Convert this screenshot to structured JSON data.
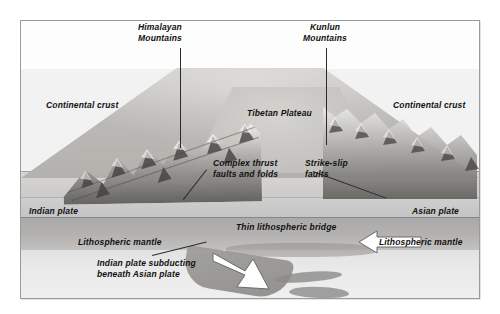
{
  "figure": {
    "title_alt": "Block diagram of the Himalaya–Tibet collision zone",
    "type": "geological-cross-section-block-diagram",
    "frame_background": "#f2f2f2",
    "border_color": "#9a9a9a"
  },
  "labels": {
    "himalayan_mountains": "Himalayan\nMountains",
    "kunlun_mountains": "Kunlun\nMountains",
    "continental_crust_left": "Continental crust",
    "continental_crust_right": "Continental crust",
    "tibetan_plateau": "Tibetan Plateau",
    "complex_thrust_faults": "Complex thrust\nfaults and folds",
    "strike_slip_faults": "Strike-slip\nfaults",
    "indian_plate": "Indian plate",
    "asian_plate": "Asian plate",
    "lithospheric_mantle_left": "Lithospheric mantle",
    "lithospheric_mantle_right": "Lithospheric mantle",
    "thin_lithospheric_bridge": "Thin lithospheric bridge",
    "indian_plate_subducting": "Indian plate subducting\nbeneath Asian plate"
  },
  "features": {
    "arrow_subduction_name": "subduction-arrow",
    "arrow_convergence_name": "asian-plate-convergence-arrow",
    "slab_fragment_count": 2
  },
  "colors": {
    "text": "#111111",
    "leader_line": "#2b2b2b",
    "crust": "#cdcbc7",
    "lithospheric_mantle": "#b4b2b0",
    "asthenosphere": "#eaeaea",
    "arrow_fill": "#ffffff",
    "arrow_stroke": "#6b6b6b"
  }
}
